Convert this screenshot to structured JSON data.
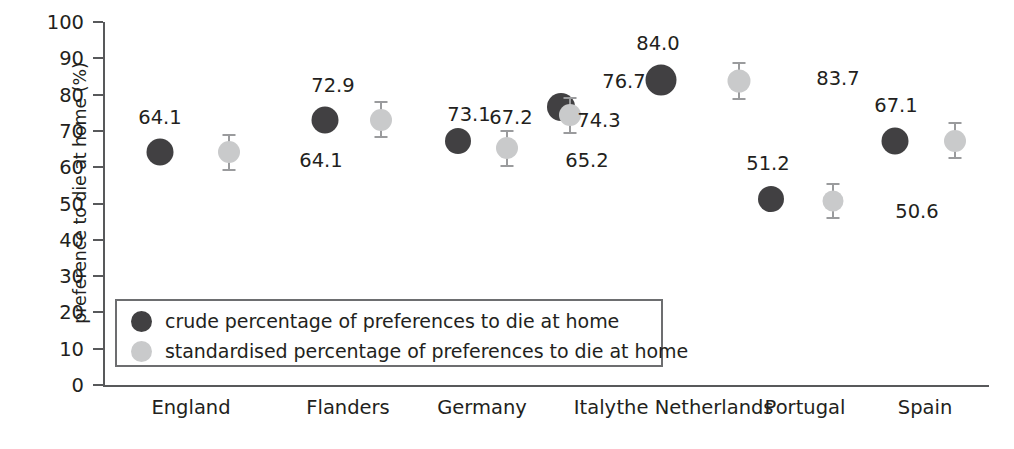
{
  "chart_data": {
    "type": "scatter",
    "title": "",
    "xlabel": "",
    "ylabel": "preference to die at home (%)",
    "ylim": [
      0,
      100
    ],
    "yticks": [
      0,
      10,
      20,
      30,
      40,
      50,
      60,
      70,
      80,
      90,
      100
    ],
    "ytick_labels": [
      "0",
      "10",
      "20",
      "30",
      "40",
      "50",
      "60",
      "70",
      "80",
      "90",
      "100"
    ],
    "grid": false,
    "legend_position": "inside lower-left",
    "categories": [
      "England",
      "Flanders",
      "Germany",
      "Italy",
      "the Netherlands",
      "Portugal",
      "Spain"
    ],
    "series": [
      {
        "name": "crude percentage of preferences to die at home",
        "color": "#414042",
        "values": [
          64.1,
          72.9,
          67.2,
          76.7,
          84.0,
          51.2,
          67.1
        ],
        "value_labels": [
          "64.1",
          "72.9",
          "67.2",
          "76.7",
          "84.0",
          "51.2",
          "67.1"
        ]
      },
      {
        "name": "standardised percentage of preferences to die at home",
        "color": "#c9cacb",
        "values": [
          64.1,
          73.1,
          65.2,
          74.3,
          83.7,
          50.6,
          67.3
        ],
        "value_labels": [
          "64.1",
          "73.1",
          "65.2",
          "74.3",
          "83.7",
          "50.6",
          "67.3"
        ]
      }
    ]
  },
  "legend": {
    "items": [
      {
        "label": "crude percentage of preferences to die at home",
        "swatch": "crude"
      },
      {
        "label": "standardised percentage of preferences to die at home",
        "swatch": "std"
      }
    ]
  }
}
